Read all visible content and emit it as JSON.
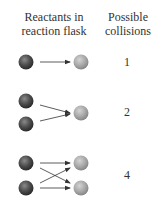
{
  "headers": {
    "reactants_line1": "Reactants in",
    "reactants_line2": "reaction flask",
    "collisions_line1": "Possible",
    "collisions_line2": "collisions"
  },
  "colors": {
    "dark_molecule": "#4a4a4a",
    "light_molecule": "#a8a8a8",
    "arrow": "#333333",
    "text": "#333333"
  },
  "rows": [
    {
      "label": "1",
      "dark_molecules": 1,
      "light_molecules": 1,
      "collisions": "1"
    },
    {
      "label": "2",
      "dark_molecules": 2,
      "light_molecules": 1,
      "collisions": "2"
    },
    {
      "label": "3",
      "dark_molecules": 2,
      "light_molecules": 2,
      "collisions": "4"
    }
  ]
}
